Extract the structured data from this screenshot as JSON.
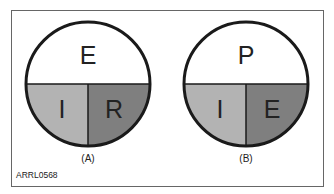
{
  "diagrams": [
    {
      "caption": "(A)",
      "top": "E",
      "bottom_left": "I",
      "bottom_right": "R"
    },
    {
      "caption": "(B)",
      "top": "P",
      "bottom_left": "I",
      "bottom_right": "E"
    }
  ],
  "figure_code": "ARRL0568",
  "colors": {
    "top": "#ffffff",
    "bottom_left": "#b3b3b3",
    "bottom_right": "#7f7f7f",
    "outline": "#1a1a1a"
  }
}
